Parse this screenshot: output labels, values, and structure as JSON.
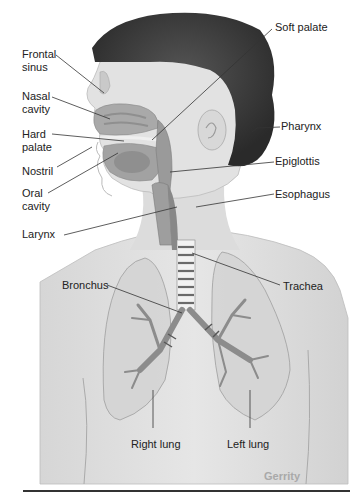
{
  "figure": {
    "credit": "Gerrity",
    "labels": {
      "frontal_sinus": "Frontal\nsinus",
      "nasal_cavity": "Nasal\ncavity",
      "hard_palate": "Hard\npalate",
      "nostril": "Nostril",
      "oral_cavity": "Oral\ncavity",
      "larynx": "Larynx",
      "soft_palate": "Soft palate",
      "pharynx": "Pharynx",
      "epiglottis": "Epiglottis",
      "esophagus": "Esophagus",
      "bronchus": "Bronchus",
      "trachea": "Trachea",
      "right_lung": "Right lung",
      "left_lung": "Left lung"
    }
  }
}
